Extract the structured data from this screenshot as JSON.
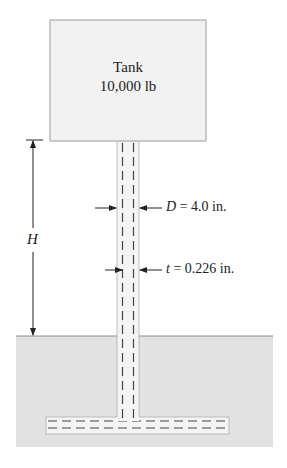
{
  "diagram": {
    "type": "engineering-figure",
    "tank": {
      "title": "Tank",
      "weight": "10,000 lb"
    },
    "dimensions": {
      "height": {
        "symbol": "H"
      },
      "diameter": {
        "symbol": "D",
        "equals": " = 4.0 in."
      },
      "thickness": {
        "symbol": "t",
        "equals": " = 0.226 in."
      }
    },
    "colors": {
      "tank_fill": "#f2f2f2",
      "tank_border": "#9a9a9a",
      "ground_fill": "#e2e2e2",
      "ground_top": "#8a8a8a",
      "pipe_fill": "#f4f4f4",
      "dash": "#444444",
      "line": "#333333"
    }
  }
}
